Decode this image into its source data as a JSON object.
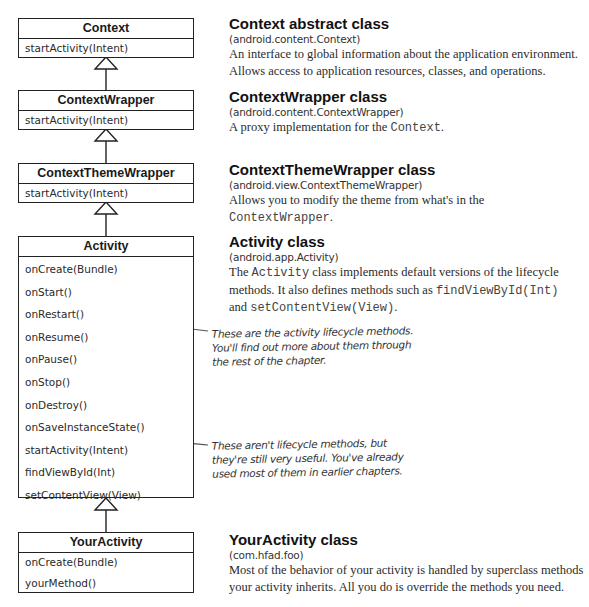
{
  "diagram": {
    "type": "uml-class-hierarchy",
    "classes": [
      {
        "name": "Context",
        "methods": [
          "startActivity(Intent)"
        ]
      },
      {
        "name": "ContextWrapper",
        "methods": [
          "startActivity(Intent)"
        ]
      },
      {
        "name": "ContextThemeWrapper",
        "methods": [
          "startActivity(Intent)"
        ]
      },
      {
        "name": "Activity",
        "methods": [
          "onCreate(Bundle)",
          "onStart()",
          "onRestart()",
          "onResume()",
          "onPause()",
          "onStop()",
          "onDestroy()",
          "onSaveInstanceState()",
          "startActivity(Intent)",
          "findViewById(Int)",
          "setContentView(View)"
        ]
      },
      {
        "name": "YourActivity",
        "methods": [
          "onCreate(Bundle)",
          "yourMethod()"
        ]
      }
    ],
    "relationships": [
      {
        "from": "ContextWrapper",
        "to": "Context",
        "type": "inheritance"
      },
      {
        "from": "ContextThemeWrapper",
        "to": "ContextWrapper",
        "type": "inheritance"
      },
      {
        "from": "Activity",
        "to": "ContextThemeWrapper",
        "type": "inheritance"
      },
      {
        "from": "YourActivity",
        "to": "Activity",
        "type": "inheritance"
      }
    ]
  },
  "descriptions": [
    {
      "title": "Context abstract class",
      "package": "(android.content.Context)",
      "body": [
        {
          "text": "An interface to global information about the application environment. Allows access to application resources, classes, and operations.",
          "mono": false
        }
      ]
    },
    {
      "title": "ContextWrapper class",
      "package": "(android.content.ContextWrapper)",
      "body": [
        {
          "text": "A proxy implementation for the ",
          "mono": false
        },
        {
          "text": "Context",
          "mono": true
        },
        {
          "text": ".",
          "mono": false
        }
      ]
    },
    {
      "title": "ContextThemeWrapper class",
      "package": "(android.view.ContextThemeWrapper)",
      "body": [
        {
          "text": "Allows you to modify the theme from what's in the ",
          "mono": false
        },
        {
          "text": "ContextWrapper",
          "mono": true
        },
        {
          "text": ".",
          "mono": false
        }
      ]
    },
    {
      "title": "Activity class",
      "package": "(android.app.Activity)",
      "body": [
        {
          "text": "The ",
          "mono": false
        },
        {
          "text": "Activity",
          "mono": true
        },
        {
          "text": " class implements default versions of the lifecycle methods. It also defines methods such as ",
          "mono": false
        },
        {
          "text": "findViewById(Int)",
          "mono": true
        },
        {
          "text": " and ",
          "mono": false
        },
        {
          "text": "setContentView(View)",
          "mono": true
        },
        {
          "text": ".",
          "mono": false
        }
      ]
    },
    {
      "title": "YourActivity class",
      "package": "(com.hfad.foo)",
      "body": [
        {
          "text": "Most of the behavior of your activity is handled by superclass methods your activity inherits. All you do is override the methods you need.",
          "mono": false
        }
      ]
    }
  ],
  "annotations": [
    {
      "lines": [
        "These are the activity lifecycle methods.",
        "You'll find out more about them through",
        "the rest of the chapter."
      ]
    },
    {
      "lines": [
        "These aren't lifecycle methods, but",
        "they're still very useful. You've already",
        "used most of them in earlier chapters."
      ]
    }
  ],
  "colors": {
    "line": "#222222",
    "text": "#1c1c1c",
    "body_text": "#2b2b2b",
    "mono_text": "#444444",
    "background": "#ffffff"
  }
}
